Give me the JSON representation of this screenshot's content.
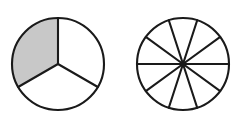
{
  "figure": {
    "background_color": "#ffffff",
    "stroke_color": "#1a1a1a",
    "unshaded_color": "#ffffff",
    "shaded_color": "#c8c8c8",
    "width": 244,
    "height": 129
  },
  "chart_data": {
    "type": "pie",
    "title": "",
    "xlabel": "",
    "ylabel": "",
    "legend": [],
    "charts": [
      {
        "name": "left-circle",
        "label": "circle divided into thirds, one third shaded",
        "total_sectors": 3,
        "shaded_sectors": 1,
        "fraction": "1/3",
        "center": {
          "x": 58,
          "y": 64
        },
        "radius": 46,
        "sector_angle_degrees": 120,
        "spoke_angles_degrees": [
          90,
          210,
          330
        ],
        "sectors": [
          {
            "index": 0,
            "start_angle": 90,
            "end_angle": 210,
            "shaded": true,
            "fill": "#c8c8c8"
          },
          {
            "index": 1,
            "start_angle": 210,
            "end_angle": 330,
            "shaded": false,
            "fill": "#ffffff"
          },
          {
            "index": 2,
            "start_angle": 330,
            "end_angle": 450,
            "shaded": false,
            "fill": "#ffffff"
          }
        ]
      },
      {
        "name": "right-circle",
        "label": "circle divided into ten equal sectors, none shaded",
        "total_sectors": 10,
        "shaded_sectors": 0,
        "fraction": "0/10",
        "center": {
          "x": 61,
          "y": 64
        },
        "radius": 46,
        "sector_angle_degrees": 36,
        "spoke_angles_degrees": [
          0,
          36,
          72,
          108,
          144,
          180,
          216,
          252,
          288,
          324
        ],
        "sectors": [
          {
            "index": 0,
            "start_angle": 0,
            "end_angle": 36,
            "shaded": false,
            "fill": "#ffffff"
          },
          {
            "index": 1,
            "start_angle": 36,
            "end_angle": 72,
            "shaded": false,
            "fill": "#ffffff"
          },
          {
            "index": 2,
            "start_angle": 72,
            "end_angle": 108,
            "shaded": false,
            "fill": "#ffffff"
          },
          {
            "index": 3,
            "start_angle": 108,
            "end_angle": 144,
            "shaded": false,
            "fill": "#ffffff"
          },
          {
            "index": 4,
            "start_angle": 144,
            "end_angle": 180,
            "shaded": false,
            "fill": "#ffffff"
          },
          {
            "index": 5,
            "start_angle": 180,
            "end_angle": 216,
            "shaded": false,
            "fill": "#ffffff"
          },
          {
            "index": 6,
            "start_angle": 216,
            "end_angle": 252,
            "shaded": false,
            "fill": "#ffffff"
          },
          {
            "index": 7,
            "start_angle": 252,
            "end_angle": 288,
            "shaded": false,
            "fill": "#ffffff"
          },
          {
            "index": 8,
            "start_angle": 288,
            "end_angle": 324,
            "shaded": false,
            "fill": "#ffffff"
          },
          {
            "index": 9,
            "start_angle": 324,
            "end_angle": 360,
            "shaded": false,
            "fill": "#ffffff"
          }
        ]
      }
    ]
  }
}
